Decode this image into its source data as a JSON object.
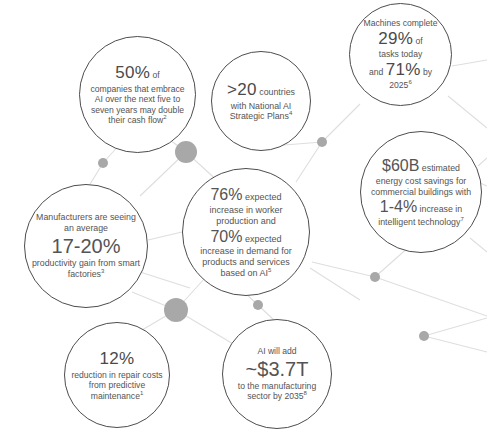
{
  "title": "THE AI STORY: WHAT THE DATA SAYS",
  "nodes": {
    "fifty_percent": {
      "stat": "50%",
      "after_stat": " of",
      "body": "companies that embrace AI over the next five to seven years may double their cash flow",
      "footnote": "2"
    },
    "countries": {
      "stat": ">20",
      "after_stat": " countries",
      "body": "with National AI Strategic Plans",
      "footnote": "4"
    },
    "machines": {
      "lead": "Machines complete",
      "stat": "29%",
      "after_stat": " of",
      "mid": "tasks today",
      "and": "and ",
      "stat2": "71%",
      "after_stat2": " by",
      "year": "2025",
      "footnote": "6"
    },
    "energy": {
      "stat": "$60B",
      "after_stat": " estimated",
      "body1": "energy cost savings for commercial buildings with",
      "stat2": "1-4%",
      "after_stat2": " increase in",
      "body2": "intelligent technology",
      "footnote": "7"
    },
    "workforce": {
      "stat": "76%",
      "after_stat": " expected",
      "body1": "increase in worker production and",
      "stat2": "70%",
      "after_stat2": " expected",
      "body2": "increase in demand for products and services based on AI",
      "footnote": "5"
    },
    "manufacturers": {
      "lead": "Manufacturers are seeing an average",
      "stat": "17-20%",
      "body": "productivity gain from smart factories",
      "footnote": "3"
    },
    "repair": {
      "stat": "12%",
      "body": "reduction in repair costs from predictive maintenance",
      "footnote": "1"
    },
    "gdp": {
      "lead": "AI will add",
      "stat": "~$3.7T",
      "body": "to the manufacturing sector by 2035",
      "footnote": "8"
    }
  },
  "colors": {
    "circle_stroke": "#4d4d4d",
    "text": "#545454",
    "link_line": "#d9d9d9",
    "node_dot": "#a8a8a8",
    "title": "#6b5b8e",
    "background": "#ffffff"
  },
  "network": {
    "dots": [
      {
        "name": "dot-small-left",
        "cx": 103,
        "cy": 163,
        "r": 5
      },
      {
        "name": "dot-large-upper-mid",
        "cx": 186,
        "cy": 152,
        "r": 11
      },
      {
        "name": "dot-small-right-upper",
        "cx": 322,
        "cy": 142,
        "r": 5
      },
      {
        "name": "dot-small-right-lower",
        "cx": 375,
        "cy": 277,
        "r": 5
      },
      {
        "name": "dot-large-lower-mid",
        "cx": 176,
        "cy": 310,
        "r": 12
      },
      {
        "name": "dot-small-bottom-mid",
        "cx": 258,
        "cy": 305,
        "r": 5
      },
      {
        "name": "dot-small-far-right",
        "cx": 424,
        "cy": 336,
        "r": 5
      }
    ]
  }
}
